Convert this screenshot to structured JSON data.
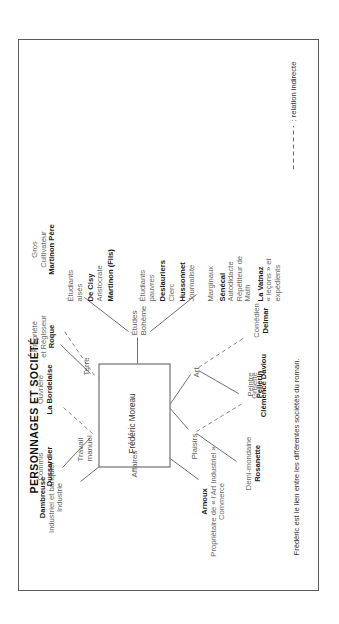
{
  "diagram": {
    "title": "PERSONNAGES ET SOCIÉTÉ",
    "center_node": "Frédéric Moreau",
    "branches": [
      {
        "key": "affaires",
        "label": "Affaires"
      },
      {
        "key": "travail_manuel",
        "label": "Travail\nmanuel"
      },
      {
        "key": "terre",
        "label": "Terre"
      },
      {
        "key": "etudes_boheme",
        "label": "Études\nBohème"
      },
      {
        "key": "plaisirs",
        "label": "Plaisirs"
      },
      {
        "key": "art",
        "label": "Art"
      }
    ],
    "groups": [
      {
        "key": "dambreuse",
        "name": "Dambreuse",
        "role": "Industriel et banquier",
        "domain": "Industrie"
      },
      {
        "key": "arnoux",
        "name": "Arnoux",
        "role": "Propriétaire de « l'Art Industriel »",
        "domain": "Commerce"
      },
      {
        "key": "dussardier",
        "role": "Commis",
        "name": "Dussardier"
      },
      {
        "key": "la_bordelaise",
        "role": "Ouvrière",
        "name": "La Bordelaise"
      },
      {
        "key": "roque",
        "role": "Propriété\net Régisseur",
        "name": "Roque"
      },
      {
        "key": "martinon_pere",
        "role": "Gros\nCultivateur",
        "name": "Martinon Père"
      },
      {
        "key": "etudiants_aises",
        "role": "Étudiants\naisés",
        "name": "De Cisy",
        "sub": "Aristocrate",
        "name2": "Martinon (Fils)"
      },
      {
        "key": "etudiants_pauvres",
        "role": "Étudiants\npauvres",
        "name": "Deslauriers",
        "sub": "Clerc",
        "name2": "Hussonnet",
        "sub2": "Journaliste"
      },
      {
        "key": "marginaux",
        "role": "Marginaux",
        "name": "Sénécal",
        "sub": "Autodidacte\nRépétiteur de\nMath",
        "name2": "La Vatnaz",
        "sub2": "« leçons » et\nexpédients"
      },
      {
        "key": "rosanette",
        "role": "Demi-mondaine",
        "name": "Rosanette"
      },
      {
        "key": "clemence_daviou",
        "role": "Grisette",
        "name": "Clémence Daviou"
      },
      {
        "key": "pellerin",
        "role": "Peintre",
        "name": "Pellerin"
      },
      {
        "key": "delmar",
        "role": "Comédien",
        "name": "Delmar"
      }
    ],
    "legend": ": relation indirecte",
    "caption": "Frédéric est le lien entre les différentes sociétés du roman."
  }
}
